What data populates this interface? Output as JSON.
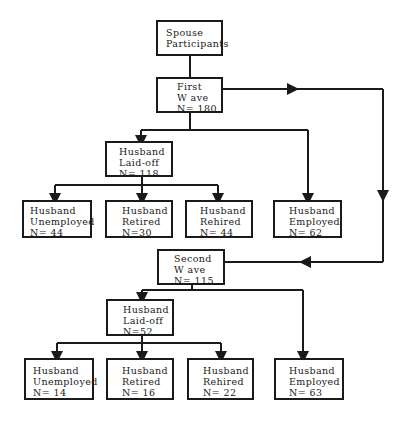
{
  "diagram": {
    "type": "flowchart",
    "nodes": {
      "root": {
        "lines": [
          "Spouse",
          "Participants"
        ]
      },
      "wave1": {
        "lines": [
          "First",
          "W ave",
          "N= 180"
        ]
      },
      "w1_laidoff": {
        "lines": [
          "Husband",
          "Laid-off",
          "N= 118"
        ]
      },
      "w1_unemp": {
        "lines": [
          "Husband",
          "Unemployed",
          "N= 44"
        ]
      },
      "w1_retired": {
        "lines": [
          "Husband",
          "Retired",
          "N=30"
        ]
      },
      "w1_rehired": {
        "lines": [
          "Husband",
          "Rehired",
          "N= 44"
        ]
      },
      "w1_employed": {
        "lines": [
          "Husband",
          "Employed",
          "N= 62"
        ]
      },
      "wave2": {
        "lines": [
          "Second",
          "W ave",
          "N= 115"
        ]
      },
      "w2_laidoff": {
        "lines": [
          "Husband",
          "Laid-off",
          "N=52"
        ]
      },
      "w2_unemp": {
        "lines": [
          "Husband",
          "Unemployed",
          "N= 14"
        ]
      },
      "w2_retired": {
        "lines": [
          "Husband",
          "Retired",
          "N= 16"
        ]
      },
      "w2_rehired": {
        "lines": [
          "Husband",
          "Rehired",
          "N= 22"
        ]
      },
      "w2_employed": {
        "lines": [
          "Husband",
          "Employed",
          "N= 63"
        ]
      }
    },
    "edges": [
      [
        "root",
        "wave1"
      ],
      [
        "wave1",
        "w1_laidoff"
      ],
      [
        "wave1",
        "w1_employed"
      ],
      [
        "wave1",
        "wave2"
      ],
      [
        "w1_laidoff",
        "w1_unemp"
      ],
      [
        "w1_laidoff",
        "w1_retired"
      ],
      [
        "w1_laidoff",
        "w1_rehired"
      ],
      [
        "wave2",
        "w2_laidoff"
      ],
      [
        "wave2",
        "w2_employed"
      ],
      [
        "w2_laidoff",
        "w2_unemp"
      ],
      [
        "w2_laidoff",
        "w2_retired"
      ],
      [
        "w2_laidoff",
        "w2_rehired"
      ]
    ],
    "line_color": "#1a1a1a"
  }
}
